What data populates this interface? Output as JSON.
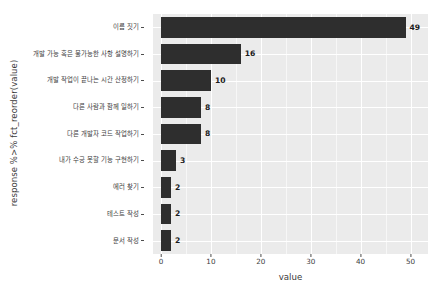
{
  "chart_data": {
    "type": "bar",
    "orientation": "horizontal",
    "title": "",
    "xlabel": "value",
    "ylabel": "response %>% fct_reorder(value)",
    "categories": [
      "이름 짓기",
      "개발 가능 혹은 불가능한 사항 설명하기",
      "개발 작업이 끝나는 시간 산정하기",
      "다른 사람과 함께 일하기",
      "다른 개발자 코드 작업하기",
      "내가 수긍 못할 기능 구현하기",
      "에러 찾기",
      "테스트 작성",
      "문서 작성"
    ],
    "values": [
      49,
      16,
      10,
      8,
      8,
      3,
      2,
      2,
      2
    ],
    "value_labels": [
      "49",
      "16",
      "10",
      "8",
      "8",
      "3",
      "2",
      "2",
      "2"
    ],
    "xlim": [
      -1.6,
      53.5
    ],
    "xticks": [
      0,
      10,
      20,
      30,
      40,
      50
    ],
    "xtick_labels": [
      "0",
      "10",
      "20",
      "30",
      "40",
      "50"
    ],
    "xticks_minor": [
      5,
      15,
      25,
      35,
      45
    ],
    "grid": true,
    "legend": "none",
    "bar_color": "#2e2e2e",
    "panel_color": "#ebebeb",
    "grid_color": "#ffffff"
  }
}
